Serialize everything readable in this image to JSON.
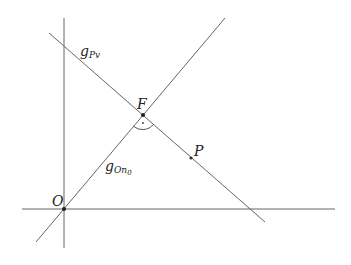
{
  "diagram": {
    "title": "",
    "points": {
      "O": {
        "label": "O",
        "x": 64,
        "y": 209
      },
      "F": {
        "label": "F",
        "x": 143,
        "y": 115
      },
      "P": {
        "label": "P",
        "x": 191,
        "y": 158
      }
    },
    "lines": {
      "g_On0": {
        "label_main": "g",
        "label_sub": "On",
        "label_subsub": "0"
      },
      "g_Pv": {
        "label_main": "g",
        "label_sub": "Pv"
      }
    },
    "axes": {
      "horizontal": {
        "label": ""
      },
      "vertical": {
        "label": ""
      }
    },
    "right_angle_at": "F",
    "colors": {
      "line": "#555555",
      "point": "#222222",
      "text": "#222222"
    }
  }
}
